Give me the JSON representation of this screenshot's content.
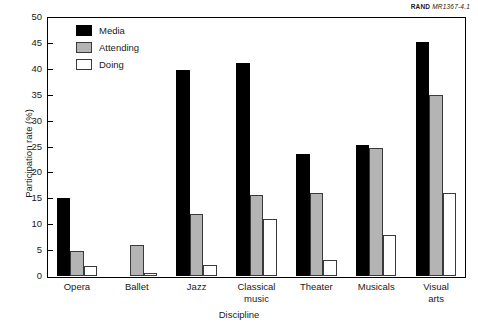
{
  "source_credit": {
    "brand": "RAND",
    "document_id": "MR1367-4.1"
  },
  "chart_data": {
    "type": "bar",
    "title": "",
    "xlabel": "Discipline",
    "ylabel": "Participation rate (%)",
    "ylim": [
      0,
      50
    ],
    "ytick_step": 5,
    "yticks": [
      0,
      5,
      10,
      15,
      20,
      25,
      30,
      35,
      40,
      45,
      50
    ],
    "ytick_labels": [
      "0",
      "5",
      "10",
      "15",
      "20",
      "25",
      "30",
      "35",
      "40",
      "45",
      "50"
    ],
    "grid": false,
    "legend_position": "upper left",
    "categories": [
      "Opera",
      "Ballet",
      "Jazz",
      "Classical music",
      "Theater",
      "Musicals",
      "Visual arts"
    ],
    "category_label_lines": [
      [
        "Opera"
      ],
      [
        "Ballet"
      ],
      [
        "Jazz"
      ],
      [
        "Classical",
        "music"
      ],
      [
        "Theater"
      ],
      [
        "Musicals"
      ],
      [
        "Visual",
        "arts"
      ]
    ],
    "series": [
      {
        "name": "Media",
        "color": "#000000",
        "values": [
          15.0,
          0.0,
          39.7,
          41.2,
          23.5,
          25.3,
          45.2
        ]
      },
      {
        "name": "Attending",
        "color": "#b4b4b4",
        "values": [
          4.9,
          6.0,
          12.0,
          15.7,
          16.0,
          24.7,
          35.0
        ]
      },
      {
        "name": "Doing",
        "color": "#ffffff",
        "values": [
          1.9,
          0.6,
          2.2,
          11.0,
          3.0,
          8.0,
          16.0
        ]
      }
    ]
  }
}
